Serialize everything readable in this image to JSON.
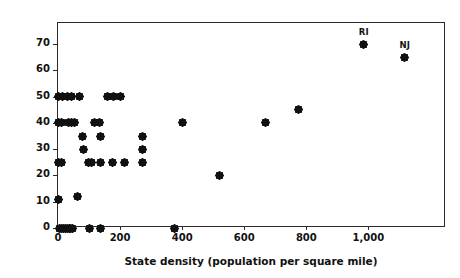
{
  "chart_data": {
    "type": "scatter",
    "title": "",
    "xlabel": "State density (population per square mile)",
    "ylabel": "State recycling target (percent)",
    "xlim": [
      0,
      1250
    ],
    "ylim": [
      0,
      78
    ],
    "xticks": [
      0,
      200,
      400,
      600,
      800,
      1000
    ],
    "xticklabels": [
      "0",
      "200",
      "400",
      "600",
      "800",
      "1,000"
    ],
    "yticks": [
      0,
      10,
      20,
      30,
      40,
      50,
      60,
      70
    ],
    "yticklabels": [
      "0",
      "10",
      "20",
      "30",
      "40",
      "50",
      "60",
      "70"
    ],
    "grid": false,
    "legend": false,
    "marker": "diamond",
    "marker_color": "#111111",
    "series": [
      {
        "name": "States",
        "points": [
          {
            "x": 1,
            "y": 50
          },
          {
            "x": 16,
            "y": 50
          },
          {
            "x": 30,
            "y": 50
          },
          {
            "x": 42,
            "y": 50
          },
          {
            "x": 68,
            "y": 50
          },
          {
            "x": 161,
            "y": 50
          },
          {
            "x": 180,
            "y": 50
          },
          {
            "x": 200,
            "y": 50
          },
          {
            "x": 1,
            "y": 40
          },
          {
            "x": 11,
            "y": 40
          },
          {
            "x": 33,
            "y": 40
          },
          {
            "x": 42,
            "y": 40
          },
          {
            "x": 52,
            "y": 40
          },
          {
            "x": 118,
            "y": 40
          },
          {
            "x": 135,
            "y": 40
          },
          {
            "x": 400,
            "y": 40
          },
          {
            "x": 670,
            "y": 40
          },
          {
            "x": 775,
            "y": 45
          },
          {
            "x": 80,
            "y": 35
          },
          {
            "x": 136,
            "y": 35
          },
          {
            "x": 272,
            "y": 35
          },
          {
            "x": 82,
            "y": 30
          },
          {
            "x": 272,
            "y": 30
          },
          {
            "x": 1,
            "y": 25
          },
          {
            "x": 10,
            "y": 25
          },
          {
            "x": 97,
            "y": 25
          },
          {
            "x": 107,
            "y": 25
          },
          {
            "x": 136,
            "y": 25
          },
          {
            "x": 175,
            "y": 25
          },
          {
            "x": 213,
            "y": 25
          },
          {
            "x": 272,
            "y": 25
          },
          {
            "x": 520,
            "y": 20
          },
          {
            "x": 62,
            "y": 12
          },
          {
            "x": 1,
            "y": 11
          },
          {
            "x": 5,
            "y": 0
          },
          {
            "x": 12,
            "y": 0
          },
          {
            "x": 18,
            "y": 0
          },
          {
            "x": 24,
            "y": 0
          },
          {
            "x": 30,
            "y": 0
          },
          {
            "x": 36,
            "y": 0
          },
          {
            "x": 41,
            "y": 0
          },
          {
            "x": 47,
            "y": 0
          },
          {
            "x": 103,
            "y": 0
          },
          {
            "x": 138,
            "y": 0
          },
          {
            "x": 375,
            "y": 0
          }
        ]
      }
    ],
    "annotations": [
      {
        "label": "RI",
        "x": 985,
        "y": 70
      },
      {
        "label": "NJ",
        "x": 1116,
        "y": 65
      }
    ]
  }
}
